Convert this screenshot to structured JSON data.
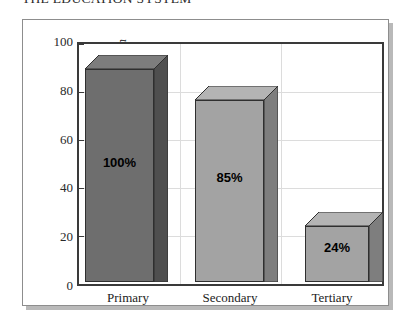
{
  "chart_data": {
    "type": "bar",
    "title": "THE EDUCATION SYSTEM",
    "xlabel": "",
    "ylabel": "% of each age group in education",
    "categories": [
      "Primary",
      "Secondary",
      "Tertiary"
    ],
    "values": [
      100,
      85,
      24
    ],
    "value_labels": [
      "100%",
      "85%",
      "24%"
    ],
    "ylim": [
      0,
      100
    ],
    "y_ticks": [
      0,
      20,
      40,
      60,
      80,
      100
    ],
    "y_tick_labels": [
      "0",
      "20",
      "40",
      "60",
      "80",
      "100"
    ],
    "grid": true,
    "legend": "none",
    "style": "3d-column",
    "bar_colors": [
      "#6e6e6e",
      "#a3a3a3",
      "#a3a3a3"
    ],
    "bar_top_colors": [
      "#7d7d7d",
      "#b4b4b4",
      "#b4b4b4"
    ],
    "bar_side_colors": [
      "#4f4f4f",
      "#7e7e7e",
      "#7e7e7e"
    ]
  },
  "chart": {
    "title": "THE EDUCATION SYSTEM",
    "y_axis_label": "% of each age group in education",
    "y_ticks": [
      {
        "label": "100"
      },
      {
        "label": "80"
      },
      {
        "label": "60"
      },
      {
        "label": "40"
      },
      {
        "label": "20"
      },
      {
        "label": "0"
      }
    ],
    "bars": [
      {
        "category": "Primary",
        "value_label": "100%"
      },
      {
        "category": "Secondary",
        "value_label": "85%"
      },
      {
        "category": "Tertiary",
        "value_label": "24%"
      }
    ]
  }
}
